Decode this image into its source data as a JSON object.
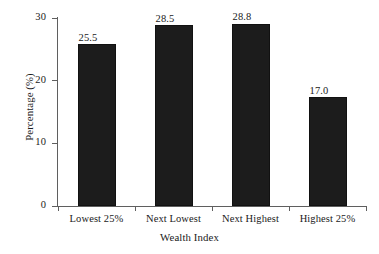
{
  "chart_data": {
    "type": "bar",
    "title": "",
    "subtitle": "",
    "xlabel": "Wealth Index",
    "ylabel": "Percentage (%)",
    "categories": [
      "Lowest 25%",
      "Next Lowest",
      "Next Highest",
      "Highest 25%"
    ],
    "values": [
      25.5,
      28.5,
      28.8,
      17.0
    ],
    "data_labels": [
      "25.5",
      "28.5",
      "28.8",
      "17.0"
    ],
    "ylim": [
      0,
      30
    ],
    "yticks": [
      0,
      10,
      20,
      30
    ],
    "ytick_labels": [
      "0",
      "10",
      "20",
      "30"
    ],
    "grid": false,
    "legend": null,
    "legend_position": "none",
    "bar_color": "#1c1c1c",
    "axis_color": "#5f5f5f",
    "background": "#ffffff",
    "annotations": []
  },
  "axes": {
    "y_title": "Percentage (%)",
    "x_title": "Wealth Index"
  }
}
